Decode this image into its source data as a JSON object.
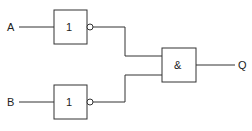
{
  "inputs": {
    "a_label": "A",
    "b_label": "B"
  },
  "output": {
    "q_label": "Q"
  },
  "gates": {
    "not_top_label": "1",
    "not_bottom_label": "1",
    "and_label": "&"
  },
  "colors": {
    "stroke": "#333333",
    "background": "#ffffff"
  }
}
